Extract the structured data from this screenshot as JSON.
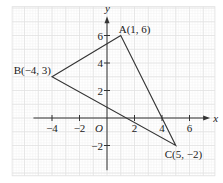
{
  "figure": {
    "type": "coordinate-plane-triangle",
    "axes": {
      "x_label": "x",
      "y_label": "y",
      "origin_label": "O",
      "x_range": [
        -6.9,
        7.85
      ],
      "y_range": [
        -4.2,
        8.1
      ],
      "x_ticks": [
        -4,
        -2,
        2,
        4,
        6
      ],
      "y_ticks": [
        -2,
        2,
        4,
        6
      ],
      "x_tick_labels": [
        "−4",
        "−2",
        "2",
        "4",
        "6"
      ],
      "y_tick_labels": [
        "−2",
        "2",
        "4",
        "6"
      ]
    },
    "grid": {
      "major_step": 1,
      "minor_step": 0.2,
      "visible": true
    },
    "points": [
      {
        "name": "A",
        "x": 1,
        "y": 6,
        "label": "A(1, 6)",
        "label_position": "top-right"
      },
      {
        "name": "B",
        "x": -4,
        "y": 3,
        "label": "B(−4, 3)",
        "label_position": "top-left"
      },
      {
        "name": "C",
        "x": 5,
        "y": -2,
        "label": "C(5, −2)",
        "label_position": "bottom-right"
      }
    ],
    "polygon": [
      "A",
      "B",
      "C"
    ],
    "colors": {
      "axis": "#333333",
      "triangle": "#333333",
      "grid_major": "#e2e2e2",
      "grid_minor": "#f2f2f2",
      "text": "#222222"
    }
  }
}
